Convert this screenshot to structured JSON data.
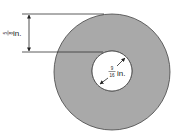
{
  "diagram": {
    "type": "washer-dimension-drawing",
    "colors": {
      "washer_fill": "#a9a9a9",
      "stroke": "#333333",
      "background": "#ffffff"
    },
    "dimensions": {
      "ring_width": {
        "numerator": "5",
        "denominator": "8",
        "unit": "in."
      },
      "hole_diameter": {
        "numerator": "9",
        "denominator": "16",
        "unit": "in."
      }
    }
  }
}
